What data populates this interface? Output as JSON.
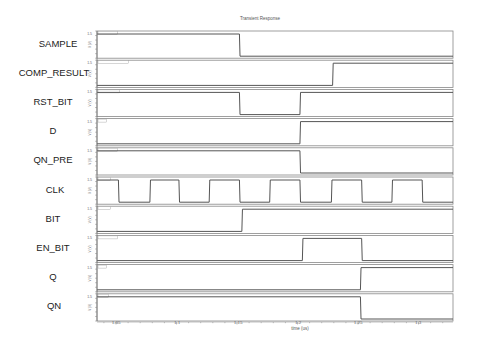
{
  "chart_data": {
    "type": "line",
    "title": "Transient Response",
    "xlabel": "time (us)",
    "ylabel": "V (V)",
    "xlim": [
      1.0343,
      1.3285
    ],
    "x_ticks": [
      1.05,
      1.1,
      1.15,
      1.2,
      1.25,
      1.3
    ],
    "x_tick_labels": [
      "1.05",
      "1.1",
      "1.15",
      "1.2",
      "1.25",
      "1.3"
    ],
    "grid": false,
    "legend": "none (per-panel signal name labels on left)",
    "style": "stacked digital timing diagram, 10 panels",
    "y_levels": {
      "low": 0,
      "high": 1.5
    },
    "series": [
      {
        "name": "SAMPLE",
        "initial": 1,
        "transitions": [
          1.152
        ]
      },
      {
        "name": "COMP_RESULT",
        "initial": 0,
        "transitions": [
          1.229
        ]
      },
      {
        "name": "RST_BIT",
        "initial": 1,
        "transitions": [
          1.152,
          1.202
        ]
      },
      {
        "name": "D",
        "initial": 0,
        "transitions": [
          1.202
        ]
      },
      {
        "name": "QN_PRE",
        "initial": 1,
        "transitions": [
          1.202
        ]
      },
      {
        "name": "CLK",
        "initial": 1,
        "transitions": [
          1.052,
          1.078,
          1.102,
          1.127,
          1.152,
          1.177,
          1.202,
          1.228,
          1.253,
          1.278,
          1.303
        ]
      },
      {
        "name": "BIT",
        "initial": 0,
        "transitions": [
          1.154
        ]
      },
      {
        "name": "EN_BIT",
        "initial": 0,
        "transitions": [
          1.204,
          1.253
        ]
      },
      {
        "name": "Q",
        "initial": 0,
        "transitions": [
          1.252
        ]
      },
      {
        "name": "QN",
        "initial": 1,
        "transitions": [
          1.252
        ]
      }
    ]
  },
  "labels": {
    "title": "Transient Response",
    "xlabel": "time (us)",
    "ylabel": "V (V)",
    "signals": [
      "SAMPLE",
      "COMP_RESULT",
      "RST_BIT",
      "D",
      "QN_PRE",
      "CLK",
      "BIT",
      "EN_BIT",
      "Q",
      "QN"
    ],
    "ticks": [
      "1.05",
      "1.1",
      "1.15",
      "1.2",
      "1.25",
      "1.3"
    ]
  },
  "colors": {
    "trace": "#555555",
    "frame": "#888888",
    "text": "#222222"
  }
}
